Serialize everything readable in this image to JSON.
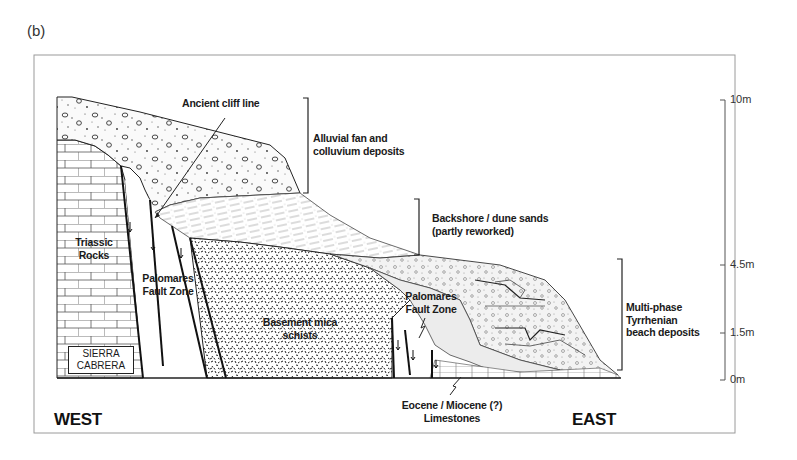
{
  "figure": {
    "panel_label": "(b)"
  },
  "labels": {
    "ancient_cliff_line": "Ancient cliff line",
    "alluvial_fan_line1": "Alluvial fan and",
    "alluvial_fan_line2": "colluvium deposits",
    "backshore_line1": "Backshore / dune sands",
    "backshore_line2": "(partly reworked)",
    "triassic_line1": "Triassic",
    "triassic_line2": "Rocks",
    "palomares_west_line1": "Palomares",
    "palomares_west_line2": "Fault Zone",
    "basement_line1": "Basement mica",
    "basement_line2": "schists",
    "palomares_east_line1": "Palomares",
    "palomares_east_line2": "Fault Zone",
    "tyrrhenian_line1": "Multi-phase",
    "tyrrhenian_line2": "Tyrrhenian",
    "tyrrhenian_line3": "beach deposits",
    "sierra_line1": "SIERRA",
    "sierra_line2": "CABRERA",
    "eocene_line1": "Eocene / Miocene (?)",
    "eocene_line2": "Limestones"
  },
  "directions": {
    "west": "WEST",
    "east": "EAST"
  },
  "scale": {
    "ticks": [
      {
        "label": "10m",
        "value": 10
      },
      {
        "label": "4.5m",
        "value": 4.5
      },
      {
        "label": "1.5m",
        "value": 1.5
      },
      {
        "label": "0m",
        "value": 0
      }
    ]
  },
  "colors": {
    "line": "#222222",
    "fill_sand": "#efefef",
    "fill_white": "#ffffff",
    "frame": "#9a9a9a"
  }
}
